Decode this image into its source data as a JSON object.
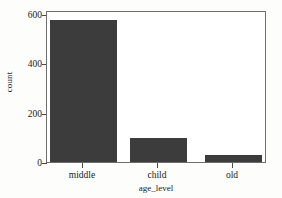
{
  "chart_data": {
    "type": "bar",
    "title": "",
    "subtitle": "",
    "xlabel": "age_level",
    "ylabel": "count",
    "categories": [
      "middle",
      "child",
      "old"
    ],
    "values": [
      588,
      100,
      28
    ],
    "series": [
      {
        "name": "count",
        "values": [
          588,
          100,
          28
        ]
      }
    ],
    "ylim": [
      0,
      620
    ],
    "yticks": [
      0,
      200,
      400,
      600
    ],
    "ytick_labels": [
      "0",
      "200",
      "400",
      "600"
    ],
    "xtick_labels": [
      "middle",
      "child",
      "old"
    ],
    "grid": false,
    "legend": false,
    "legend_position": "none",
    "bar_color": "#3c3c3c",
    "frame_color": "#6e6e6e",
    "background_color": "#ffffff",
    "text_color": "#1a1a1a",
    "annotations": []
  },
  "figure": {
    "y_axis_label": "count",
    "x_axis_label": "age_level",
    "ytick_0": "0",
    "ytick_1": "200",
    "ytick_2": "400",
    "ytick_3": "600",
    "xtick_0": "middle",
    "xtick_1": "child",
    "xtick_2": "old"
  }
}
